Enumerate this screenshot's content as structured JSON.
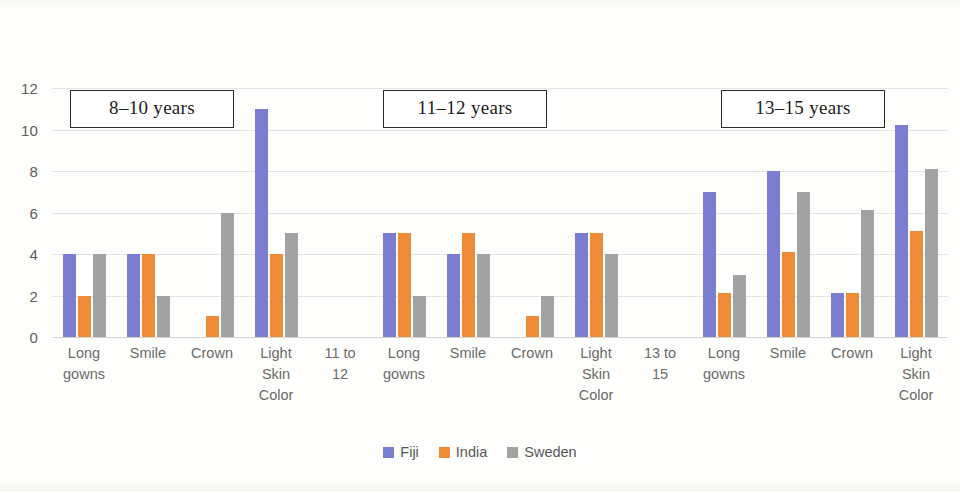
{
  "chart_data": {
    "type": "bar",
    "title": "",
    "xlabel": "",
    "ylabel": "",
    "ylim": [
      0,
      12
    ],
    "yticks": [
      0,
      2,
      4,
      6,
      8,
      10,
      12
    ],
    "grid": true,
    "legend_position": "bottom",
    "legend": [
      "Fiji",
      "India",
      "Sweden"
    ],
    "colors": {
      "Fiji": "#7a7dd0",
      "India": "#ed8b36",
      "Sweden": "#a2a2a2"
    },
    "panels": [
      {
        "title": "8–10 years",
        "categories": [
          "Long gowns",
          "Smile",
          "Crown",
          "Light Skin Color"
        ],
        "series": [
          {
            "name": "Fiji",
            "values": [
              4,
              4,
              0,
              11
            ]
          },
          {
            "name": "India",
            "values": [
              2,
              4,
              1,
              4
            ]
          },
          {
            "name": "Sweden",
            "values": [
              4,
              2,
              6,
              5
            ]
          }
        ]
      },
      {
        "title": "11–12 years",
        "categories": [
          "Long gowns",
          "Smile",
          "Crown",
          "Light Skin Color"
        ],
        "series": [
          {
            "name": "Fiji",
            "values": [
              5,
              4,
              0,
              5
            ]
          },
          {
            "name": "India",
            "values": [
              5,
              5,
              1,
              5
            ]
          },
          {
            "name": "Sweden",
            "values": [
              2,
              4,
              2,
              4
            ]
          }
        ]
      },
      {
        "title": "13–15 years",
        "categories": [
          "Long gowns",
          "Smile",
          "Crown",
          "Light Skin Color"
        ],
        "series": [
          {
            "name": "Fiji",
            "values": [
              7,
              8,
              2.1,
              10.2
            ]
          },
          {
            "name": "India",
            "values": [
              2.1,
              4.1,
              2.1,
              5.1
            ]
          },
          {
            "name": "Sweden",
            "values": [
              3,
              7,
              6.1,
              8.1
            ]
          }
        ]
      }
    ],
    "axis_tick_labels": [
      "Long gowns",
      "Smile",
      "Crown",
      "Light Skin Color",
      "11 to 12",
      "Long gowns",
      "Smile",
      "Crown",
      "Light Skin Color",
      "13 to 15",
      "Long gowns",
      "Smile",
      "Crown",
      "Light Skin Color"
    ]
  },
  "y_axis": {
    "ticks": [
      "12",
      "10",
      "8",
      "6",
      "4",
      "2",
      "0"
    ]
  },
  "panel_titles": {
    "p0": "8–10 years",
    "p1": "11–12 years",
    "p2": "13–15 years"
  },
  "legend": {
    "items": [
      {
        "label": "Fiji"
      },
      {
        "label": "India"
      },
      {
        "label": "Sweden"
      }
    ]
  },
  "x_labels": [
    {
      "text": "Long\ngowns"
    },
    {
      "text": "Smile"
    },
    {
      "text": "Crown"
    },
    {
      "text": "Light\nSkin\nColor"
    },
    {
      "text": "11 to\n12"
    },
    {
      "text": "Long\ngowns"
    },
    {
      "text": "Smile"
    },
    {
      "text": "Crown"
    },
    {
      "text": "Light\nSkin\nColor"
    },
    {
      "text": "13 to\n15"
    },
    {
      "text": "Long\ngowns"
    },
    {
      "text": "Smile"
    },
    {
      "text": "Crown"
    },
    {
      "text": "Light\nSkin\nColor"
    }
  ]
}
